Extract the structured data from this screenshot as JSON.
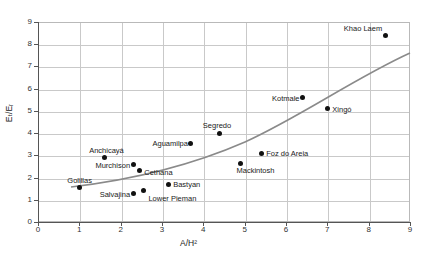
{
  "chart_data": {
    "type": "scatter",
    "title": "",
    "xlabel": "A/H²",
    "ylabel": "Eₜ/Eᵣ",
    "xlim": [
      0,
      9
    ],
    "ylim": [
      0,
      9
    ],
    "xticks": [
      0,
      1,
      2,
      3,
      4,
      5,
      6,
      7,
      8,
      9
    ],
    "yticks": [
      0,
      1,
      2,
      3,
      4,
      5,
      6,
      7,
      8,
      9
    ],
    "grid": true,
    "legend": "none",
    "point_color": "#111111",
    "trend_color": "#8a8a8a",
    "trend_note": "single upward-curving fitted trend line rising from about (0.8, 1.6) to (9.0, 7.6)",
    "points": [
      {
        "label": "Khao Laem",
        "x": 8.4,
        "y": 8.4,
        "label_dx": -46,
        "label_dy": -11
      },
      {
        "label": "Kotmale",
        "x": 6.4,
        "y": 5.6,
        "label_dx": -40,
        "label_dy": -4
      },
      {
        "label": "Xingó",
        "x": 7.0,
        "y": 5.1,
        "label_dx": 5,
        "label_dy": -4
      },
      {
        "label": "Segredo",
        "x": 4.4,
        "y": 4.0,
        "label_dx": -17,
        "label_dy": -12
      },
      {
        "label": "Aguamilpa",
        "x": 3.7,
        "y": 3.55,
        "label_dx": -48,
        "label_dy": -4
      },
      {
        "label": "Foz do Areia",
        "x": 5.4,
        "y": 3.1,
        "label_dx": 5,
        "label_dy": -4
      },
      {
        "label": "Anchicayá",
        "x": 1.6,
        "y": 2.9,
        "label_dx": -15,
        "label_dy": -12
      },
      {
        "label": "Murchison",
        "x": 2.3,
        "y": 2.6,
        "label_dx": -47,
        "label_dy": -3
      },
      {
        "label": "Cethana",
        "x": 2.45,
        "y": 2.3,
        "label_dx": 5,
        "label_dy": -3
      },
      {
        "label": "Mackintosh",
        "x": 4.9,
        "y": 2.65,
        "label_dx": -4,
        "label_dy": 3
      },
      {
        "label": "Bastyan",
        "x": 3.15,
        "y": 1.7,
        "label_dx": 5,
        "label_dy": -4
      },
      {
        "label": "Golillas",
        "x": 1.0,
        "y": 1.55,
        "label_dx": -12,
        "label_dy": -12
      },
      {
        "label": "Salvajina",
        "x": 2.3,
        "y": 1.3,
        "label_dx": -38,
        "label_dy": -3
      },
      {
        "label": "Lower Pieman",
        "x": 2.55,
        "y": 1.4,
        "label_dx": 5,
        "label_dy": 3
      }
    ]
  }
}
